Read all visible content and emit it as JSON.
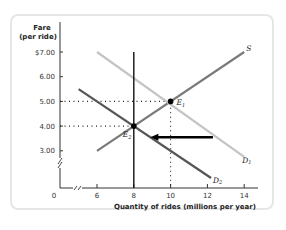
{
  "chart_data": {
    "type": "line",
    "title": "",
    "ylabel": "Fare (per ride)",
    "ylabel_lines": [
      "Fare",
      "(per ride)"
    ],
    "xlabel": "Quantity of rides (millions per year)",
    "xlim": [
      0,
      14
    ],
    "ylim": [
      0,
      7
    ],
    "x_axis_break": true,
    "y_axis_break": true,
    "x_ticks": [
      {
        "value": 0,
        "label": "0"
      },
      {
        "value": 6,
        "label": "6"
      },
      {
        "value": 8,
        "label": "8"
      },
      {
        "value": 10,
        "label": "10"
      },
      {
        "value": 12,
        "label": "12"
      },
      {
        "value": 14,
        "label": "14"
      }
    ],
    "y_ticks": [
      {
        "value": 3,
        "label": "3.00"
      },
      {
        "value": 4,
        "label": "4.00"
      },
      {
        "value": 5,
        "label": "5.00"
      },
      {
        "value": 6,
        "label": "6.00"
      },
      {
        "value": 7,
        "label": "$7.00"
      }
    ],
    "grid": false,
    "series": [
      {
        "name": "S",
        "label": "S",
        "color": "#7a7a7a",
        "points": [
          [
            6,
            3.0
          ],
          [
            14,
            7.0
          ]
        ]
      },
      {
        "name": "D1",
        "label": "D",
        "sub": "1",
        "color": "#c4c4c4",
        "points": [
          [
            6,
            7.0
          ],
          [
            14,
            2.75
          ]
        ]
      },
      {
        "name": "D2",
        "label": "D",
        "sub": "2",
        "color": "#555555",
        "points": [
          [
            5,
            5.5
          ],
          [
            12.2,
            1.9
          ]
        ]
      },
      {
        "name": "quota",
        "label": "",
        "color": "#111111",
        "points": [
          [
            8,
            0
          ],
          [
            8,
            7.0
          ]
        ]
      }
    ],
    "equilibria": [
      {
        "name": "E1",
        "label": "E",
        "sub": "1",
        "x": 10,
        "y": 5.0
      },
      {
        "name": "E2",
        "label": "E",
        "sub": "2",
        "x": 8,
        "y": 4.0
      }
    ],
    "annotations": [
      {
        "type": "arrow",
        "from": [
          12.3,
          3.55
        ],
        "to": [
          8.9,
          3.55
        ],
        "meaning": "demand shifts left from D1 to D2"
      },
      {
        "type": "dotted-guide",
        "points": [
          [
            0,
            5.0
          ],
          [
            10,
            5.0
          ],
          [
            10,
            0
          ]
        ]
      },
      {
        "type": "dotted-guide",
        "points": [
          [
            0,
            4.0
          ],
          [
            8,
            4.0
          ]
        ]
      }
    ],
    "legend": "none (inline curve labels)"
  }
}
